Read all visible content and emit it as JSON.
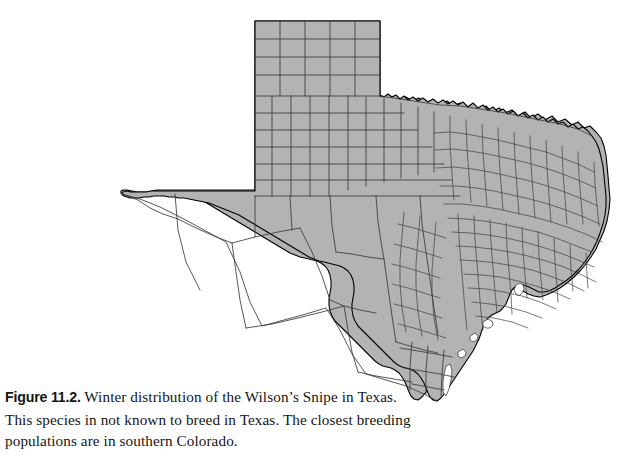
{
  "figure": {
    "label": "Figure 11.2.",
    "caption_lines": [
      "Winter distribution of the Wilson’s Snipe in Texas.",
      "This species in not known to breed in Texas. The closest breeding",
      "populations are in southern Colorado."
    ],
    "caption_full": "Figure 11.2. Winter distribution of the Wilson’s Snipe in Texas. This species in not known to breed in Texas. The closest breeding populations are in southern Colorado.",
    "species": "Wilson’s Snipe",
    "season": "Winter",
    "region": "Texas",
    "breeding_note": "southern Colorado"
  },
  "map": {
    "name": "texas-county-map",
    "title": "Texas with county boundaries",
    "type": "choropleth",
    "shading": "uniform",
    "distribution_coverage": "statewide",
    "colors": {
      "land_fill": "#b3b3b3",
      "state_outline": "#000000",
      "county_outline": "#3a3a3a",
      "water": "#ffffff",
      "background": "#ffffff"
    },
    "features": [
      "panhandle-grid-counties",
      "west-texas-large-counties",
      "east-texas-small-counties",
      "gulf-coast-bays",
      "rio-grande-border",
      "red-river-border"
    ],
    "water_bodies": [
      "Galveston Bay",
      "Matagorda Bay",
      "San Antonio Bay",
      "Corpus Christi Bay",
      "Laguna Madre"
    ]
  }
}
